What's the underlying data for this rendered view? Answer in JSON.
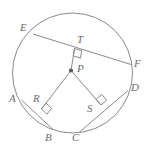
{
  "figure": {
    "kind": "circle-geometry-diagram",
    "colors": {
      "stroke": "#8a8a8a",
      "chord_stroke": "#8a8a8a",
      "label_color": "#6b6b6b",
      "center_dot": "#5a5a5a",
      "background": "#ffffff"
    },
    "circle": {
      "name": "circle-P",
      "cx": 72.5,
      "cy": 73,
      "r": 60
    },
    "center_point": {
      "name": "P",
      "x": 71,
      "y": 70.5,
      "dot_r": 2.1
    },
    "chords": [
      {
        "name": "EF",
        "from": "E",
        "to": "F",
        "x1": 33,
        "y1": 34,
        "x2": 131,
        "y2": 64.5
      },
      {
        "name": "AB",
        "from": "A",
        "to": "B",
        "x1": 21.5,
        "y1": 100,
        "x2": 53,
        "y2": 129.5
      },
      {
        "name": "CD",
        "from": "C",
        "to": "D",
        "x1": 79.5,
        "y1": 132,
        "x2": 127.5,
        "y2": 91
      }
    ],
    "radii_segments": [
      {
        "name": "P-T",
        "x1": 71,
        "y1": 70.5,
        "x2": 74.5,
        "y2": 48.5
      },
      {
        "name": "P-R",
        "x1": 71,
        "y1": 70.5,
        "x2": 41.5,
        "y2": 109
      },
      {
        "name": "P-S",
        "x1": 71,
        "y1": 70.5,
        "x2": 101,
        "y2": 105
      }
    ],
    "right_angle_marks": [
      {
        "name": "right-angle-at-T",
        "x": 74.5,
        "y": 48.5,
        "size": 7.5,
        "angle": 17
      },
      {
        "name": "right-angle-at-R",
        "x": 41.5,
        "y": 109,
        "size": 7.5,
        "angle": 43
      },
      {
        "name": "right-angle-at-S",
        "x": 101,
        "y": 105,
        "size": 7.5,
        "angle": -40
      }
    ],
    "labels": [
      {
        "name": "label-E",
        "text": "E",
        "x": 20,
        "y": 22
      },
      {
        "name": "label-T",
        "text": "T",
        "x": 77,
        "y": 34
      },
      {
        "name": "label-F",
        "text": "F",
        "x": 134,
        "y": 58
      },
      {
        "name": "label-P",
        "text": "P",
        "x": 77,
        "y": 63
      },
      {
        "name": "label-A",
        "text": "A",
        "x": 9,
        "y": 93
      },
      {
        "name": "label-R",
        "text": "R",
        "x": 33,
        "y": 93
      },
      {
        "name": "label-D",
        "text": "D",
        "x": 131,
        "y": 82
      },
      {
        "name": "label-S",
        "text": "S",
        "x": 87,
        "y": 103
      },
      {
        "name": "label-B",
        "text": "B",
        "x": 45,
        "y": 132
      },
      {
        "name": "label-C",
        "text": "C",
        "x": 72,
        "y": 132
      }
    ]
  }
}
